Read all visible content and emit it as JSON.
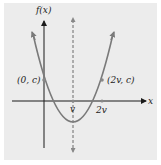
{
  "figure": {
    "type": "parabola-diagram",
    "background": "#ececec",
    "curve_color": "#7a7a7a",
    "axis_color": "#1a1a1a",
    "axes": {
      "x_label": "x",
      "y_label": "f(x)"
    },
    "points": [
      {
        "label": "(0, c)",
        "x": 0,
        "y": "c"
      },
      {
        "label": "(2v, c)",
        "x": "2v",
        "y": "c"
      }
    ],
    "x_ticks": [
      {
        "label": "v"
      },
      {
        "label": "2v"
      }
    ],
    "axis_of_symmetry": {
      "x": "v",
      "style": "dashed"
    }
  }
}
